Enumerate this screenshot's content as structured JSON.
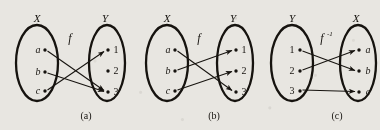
{
  "figure": {
    "ink_color": "#16130f",
    "paper_color": "#e8e6e1",
    "panels": [
      {
        "caption": "(a)",
        "map_label": "f",
        "left_set_label": "X",
        "right_set_label": "Y",
        "left_elements": [
          "a",
          "b",
          "c"
        ],
        "right_elements": [
          "1",
          "2",
          "3"
        ],
        "arrows": [
          {
            "from": "a",
            "to": "3"
          },
          {
            "from": "b",
            "to": "3"
          },
          {
            "from": "c",
            "to": "1"
          }
        ]
      },
      {
        "caption": "(b)",
        "map_label": "f",
        "left_set_label": "X",
        "right_set_label": "Y",
        "left_elements": [
          "a",
          "b",
          "c"
        ],
        "right_elements": [
          "1",
          "2",
          "3"
        ],
        "arrows": [
          {
            "from": "a",
            "to": "3"
          },
          {
            "from": "b",
            "to": "1"
          },
          {
            "from": "c",
            "to": "2"
          }
        ]
      },
      {
        "caption": "(c)",
        "map_label": "f",
        "map_label_superscript": "-1",
        "left_set_label": "Y",
        "right_set_label": "X",
        "left_elements": [
          "1",
          "2",
          "3"
        ],
        "right_elements": [
          "a",
          "b",
          "c"
        ],
        "arrows": [
          {
            "from": "1",
            "to": "b"
          },
          {
            "from": "2",
            "to": "a"
          },
          {
            "from": "3",
            "to": "c"
          }
        ]
      }
    ]
  }
}
